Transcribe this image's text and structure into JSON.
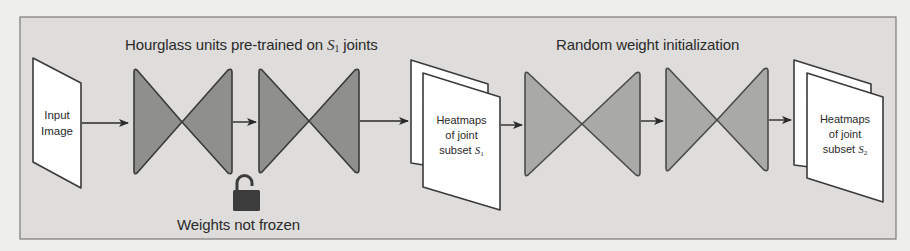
{
  "colors": {
    "page_bg": "#eeeeec",
    "frame_bg": "#dedddb",
    "frame_border": "#7a7a78",
    "pretrained_fill": "#8f8f8d",
    "random_fill": "#a9a9a7",
    "stroke": "#3a3a3a",
    "sheet_fill": "#ffffff",
    "lock_color": "#3c3c3c",
    "text": "#2a2a2a"
  },
  "groups": {
    "pretrained": {
      "title_prefix": "Hourglass units pre-trained on ",
      "title_math": "S",
      "title_sub": "1",
      "title_suffix": " joints",
      "lock_label": "Weights not frozen",
      "lock_state": "unlocked"
    },
    "random": {
      "title": "Random weight initialization"
    }
  },
  "nodes": {
    "input": {
      "line1": "Input",
      "line2": "Image"
    },
    "heatmap_s1": {
      "line1": "Heatmaps",
      "line2": "of joint",
      "line3_prefix": "subset ",
      "math": "S",
      "sub": "1"
    },
    "heatmap_s2": {
      "line1": "Heatmaps",
      "line2": "of joint",
      "line3_prefix": "subset ",
      "math": "S",
      "sub": "2"
    }
  },
  "pipeline": [
    "Input Image",
    "Hourglass unit 1 (pre-trained)",
    "Hourglass unit 2 (pre-trained)",
    "Heatmaps of joint subset S1",
    "Hourglass unit 3 (random init)",
    "Hourglass unit 4 (random init)",
    "Heatmaps of joint subset S2"
  ]
}
